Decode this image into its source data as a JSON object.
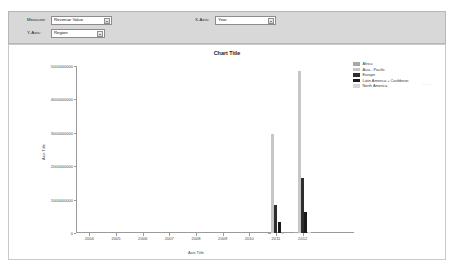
{
  "params": {
    "measure": {
      "label": "Measure:",
      "value": "Revenue Value"
    },
    "series": {
      "label": "Y-Axis:",
      "value": "Region"
    },
    "xaxis": {
      "label": "X-Axis:",
      "value": "Year"
    },
    "faint_note": "........."
  },
  "chart_data": {
    "type": "bar",
    "title": "Chart Title",
    "xlabel": "Axis Title",
    "ylabel": "Axis Title",
    "categories": [
      "2004",
      "2005",
      "2006",
      "2007",
      "2008",
      "2009",
      "2010",
      "2011",
      "2012"
    ],
    "tick_labels": [
      "2004",
      "2005",
      "2006",
      "2007",
      "2008",
      "2009",
      "2010",
      "2011",
      "2012"
    ],
    "ylim": [
      0,
      5000000000
    ],
    "ytick_values": [
      0,
      1000000000,
      2000000000,
      3000000000,
      4000000000,
      5000000000
    ],
    "ytick_labels": [
      "0",
      "1000000000",
      "2000000000",
      "3000000000",
      "4000000000",
      "5000000000"
    ],
    "grid": false,
    "legend_position": "right",
    "series": [
      {
        "name": "Africa",
        "color": "#a8a8a8",
        "values": [
          0,
          0,
          0,
          0,
          0,
          0,
          0,
          12000000,
          18000000
        ]
      },
      {
        "name": "Asia - Pacific",
        "color": "#c6c6c6",
        "values": [
          0,
          0,
          0,
          0,
          0,
          0,
          0,
          2950000000,
          4850000000
        ]
      },
      {
        "name": "Europe",
        "color": "#2e2e2e",
        "values": [
          0,
          0,
          0,
          0,
          0,
          0,
          0,
          850000000,
          1650000000
        ]
      },
      {
        "name": "Latin America + Caribbean",
        "color": "#1a1a1a",
        "values": [
          0,
          0,
          0,
          0,
          0,
          0,
          0,
          320000000,
          620000000
        ]
      },
      {
        "name": "North America",
        "color": "#d6d6d6",
        "values": [
          0,
          0,
          0,
          0,
          0,
          0,
          0,
          15000000,
          30000000
        ]
      }
    ]
  }
}
